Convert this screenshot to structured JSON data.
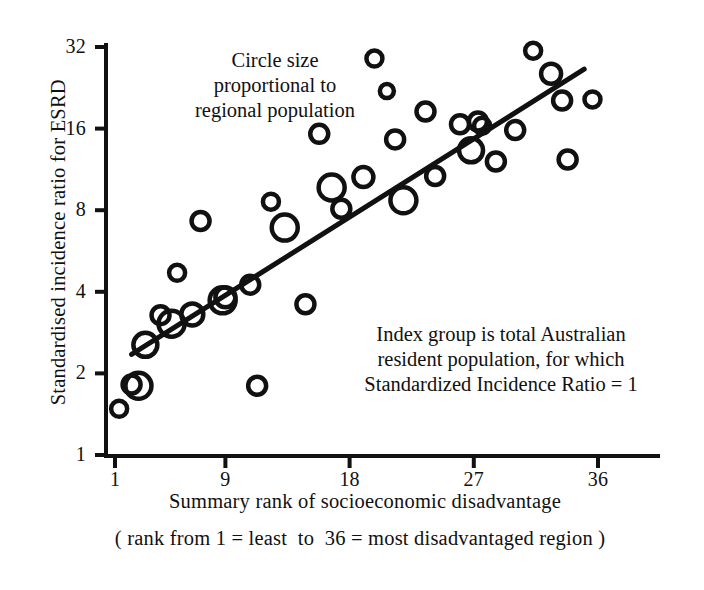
{
  "chart_data": {
    "type": "scatter",
    "title": "",
    "xlabel": "Summary rank of socioeconomic disadvantage",
    "xsublabel": "( rank from 1 = least  to  36 = most disadvantaged region )",
    "ylabel": "Standardised incidence ratio for ESRD",
    "xlim": [
      1,
      36
    ],
    "ylim": [
      1,
      32
    ],
    "yscale": "log2",
    "xscale": "linear",
    "grid": false,
    "legend": "none",
    "xticks": [
      1,
      9,
      18,
      27,
      36
    ],
    "xtick_labels": [
      "1",
      "9",
      "18",
      "27",
      "36"
    ],
    "yticks": [
      1,
      2,
      4,
      8,
      16,
      32
    ],
    "ytick_labels": [
      "1",
      "2",
      "4",
      "8",
      "16",
      "32"
    ],
    "marker": "open-circle",
    "size_encoding": "Circle size proportional to regional population",
    "annotations": [
      {
        "name": "circle-size-note",
        "lines": [
          "Circle size",
          "proportional to",
          "regional population"
        ]
      },
      {
        "name": "index-group-note",
        "lines": [
          "Index group is total Australian",
          "resident population, for which",
          "Standardized Incidence Ratio = 1"
        ]
      }
    ],
    "trendline": {
      "type": "linear-on-log2-y",
      "x_start": 2.2,
      "y_start": 2.35,
      "x_end": 35.0,
      "y_end": 26.5
    },
    "points": [
      {
        "x": 1.3,
        "y": 1.48,
        "r": 8
      },
      {
        "x": 2.2,
        "y": 1.82,
        "r": 9
      },
      {
        "x": 2.7,
        "y": 1.8,
        "r": 13
      },
      {
        "x": 3.2,
        "y": 2.55,
        "r": 12
      },
      {
        "x": 4.3,
        "y": 3.28,
        "r": 9
      },
      {
        "x": 5.1,
        "y": 3.05,
        "r": 13
      },
      {
        "x": 5.5,
        "y": 4.7,
        "r": 8
      },
      {
        "x": 6.6,
        "y": 3.3,
        "r": 11
      },
      {
        "x": 7.2,
        "y": 7.3,
        "r": 9
      },
      {
        "x": 8.8,
        "y": 3.72,
        "r": 13
      },
      {
        "x": 9.0,
        "y": 3.82,
        "r": 10
      },
      {
        "x": 10.8,
        "y": 4.25,
        "r": 9
      },
      {
        "x": 11.3,
        "y": 1.8,
        "r": 9
      },
      {
        "x": 12.3,
        "y": 8.6,
        "r": 8
      },
      {
        "x": 13.3,
        "y": 6.9,
        "r": 13
      },
      {
        "x": 14.8,
        "y": 3.6,
        "r": 9
      },
      {
        "x": 15.8,
        "y": 15.3,
        "r": 9
      },
      {
        "x": 16.7,
        "y": 9.7,
        "r": 13
      },
      {
        "x": 17.4,
        "y": 8.1,
        "r": 9
      },
      {
        "x": 19.0,
        "y": 10.6,
        "r": 10
      },
      {
        "x": 19.8,
        "y": 29.0,
        "r": 8
      },
      {
        "x": 20.7,
        "y": 22.0,
        "r": 7
      },
      {
        "x": 21.3,
        "y": 14.6,
        "r": 9
      },
      {
        "x": 21.9,
        "y": 8.7,
        "r": 13
      },
      {
        "x": 23.5,
        "y": 18.5,
        "r": 9
      },
      {
        "x": 24.2,
        "y": 10.7,
        "r": 9
      },
      {
        "x": 26.0,
        "y": 16.6,
        "r": 9
      },
      {
        "x": 26.8,
        "y": 13.3,
        "r": 12
      },
      {
        "x": 27.3,
        "y": 17.0,
        "r": 9
      },
      {
        "x": 27.6,
        "y": 16.4,
        "r": 8
      },
      {
        "x": 28.6,
        "y": 12.1,
        "r": 9
      },
      {
        "x": 30.0,
        "y": 15.8,
        "r": 9
      },
      {
        "x": 31.3,
        "y": 31.0,
        "r": 8
      },
      {
        "x": 32.6,
        "y": 25.5,
        "r": 10
      },
      {
        "x": 33.4,
        "y": 20.3,
        "r": 9
      },
      {
        "x": 33.8,
        "y": 12.3,
        "r": 9
      },
      {
        "x": 35.6,
        "y": 20.5,
        "r": 8
      }
    ]
  },
  "axes": {
    "y_title": "Standardised incidence ratio for ESRD",
    "x_title": "Summary rank of socioeconomic disadvantage",
    "x_subtitle": "( rank from 1 = least  to  36 = most disadvantaged region )"
  },
  "colors": {
    "ink": "#111111",
    "background": "#ffffff"
  }
}
